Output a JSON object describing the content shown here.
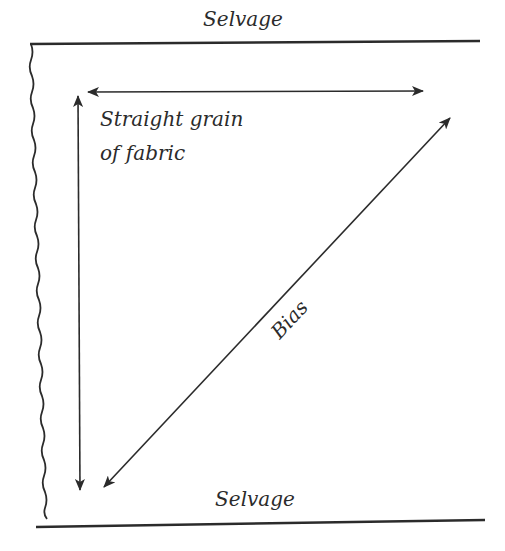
{
  "diagram": {
    "labels": {
      "top_selvage": "Selvage",
      "bottom_selvage": "Selvage",
      "straight_grain_line1": "Straight grain",
      "straight_grain_line2": "of fabric",
      "bias": "Bias"
    },
    "arrows": [
      {
        "name": "horizontal-straight-grain",
        "from": [
          88,
          92
        ],
        "to": [
          423,
          92
        ],
        "heads": "both"
      },
      {
        "name": "vertical-straight-grain",
        "from": [
          80,
          95
        ],
        "to": [
          80,
          490
        ],
        "heads": "both"
      },
      {
        "name": "bias-diagonal",
        "from": [
          450,
          118
        ],
        "to": [
          104,
          487
        ],
        "heads": "both"
      }
    ],
    "colors": {
      "line": "#2b2b2b",
      "background": "#ffffff"
    }
  }
}
